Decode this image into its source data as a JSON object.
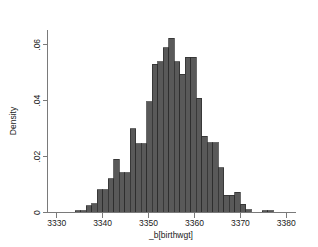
{
  "chart_data": {
    "type": "bar",
    "subtype": "histogram",
    "title": "",
    "subtitle": "",
    "xlabel": "_b[birthwgt]",
    "ylabel": "Density",
    "xlim": [
      3328,
      3382
    ],
    "ylim": [
      0,
      0.066
    ],
    "xticks": [
      3330,
      3340,
      3350,
      3360,
      3370,
      3380
    ],
    "xtick_labels": [
      "3330",
      "3340",
      "3350",
      "3360",
      "3370",
      "3380"
    ],
    "yticks": [
      0,
      0.02,
      0.04,
      0.06
    ],
    "ytick_labels": [
      "0",
      ".02",
      ".04",
      ".06"
    ],
    "grid": false,
    "legend": false,
    "legend_position": "none",
    "bin_width": 1.2,
    "bar_color": "#595959",
    "bar_edge_color": "#2b2b2b",
    "axis_color": "#7a7a7a",
    "background_color": "#ffffff",
    "categories": [
      3334.6,
      3335.8,
      3337.0,
      3338.2,
      3339.4,
      3340.6,
      3341.8,
      3343.0,
      3344.2,
      3345.4,
      3346.6,
      3347.8,
      3349.0,
      3350.2,
      3351.4,
      3352.6,
      3353.8,
      3355.0,
      3356.2,
      3357.4,
      3358.6,
      3359.8,
      3361.0,
      3362.2,
      3363.4,
      3364.6,
      3365.8,
      3367.0,
      3368.2,
      3369.4,
      3370.6,
      3371.8,
      3375.4,
      3376.6
    ],
    "values": [
      0.0006,
      0.0006,
      0.0024,
      0.0032,
      0.0082,
      0.0082,
      0.012,
      0.019,
      0.0142,
      0.0142,
      0.03,
      0.0246,
      0.0246,
      0.0396,
      0.053,
      0.054,
      0.059,
      0.0624,
      0.054,
      0.0494,
      0.0556,
      0.0556,
      0.0408,
      0.0272,
      0.025,
      0.025,
      0.016,
      0.0062,
      0.0062,
      0.0072,
      0.003,
      0.001,
      0.0006,
      0.0006
    ]
  },
  "axes": {
    "x_title": "_b[birthwgt]",
    "y_title": "Density"
  }
}
